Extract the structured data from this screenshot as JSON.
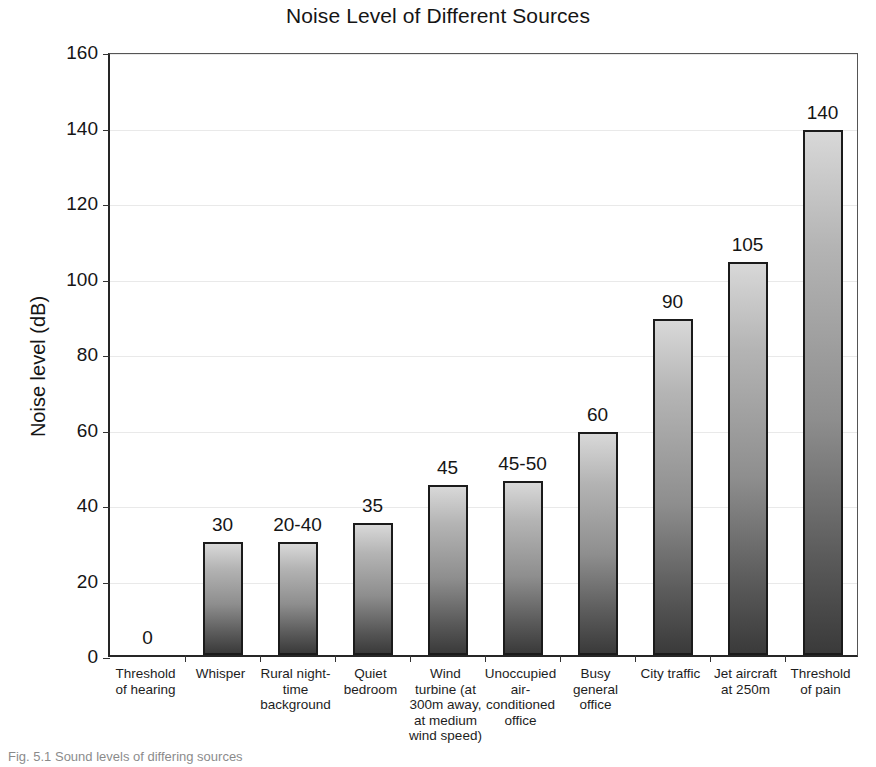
{
  "chart_data": {
    "type": "bar",
    "title": "Noise Level of Different Sources",
    "xlabel": "",
    "ylabel": "Noise level (dB)",
    "ylim": [
      0,
      160
    ],
    "yticks": [
      0,
      20,
      40,
      60,
      80,
      100,
      120,
      140,
      160
    ],
    "grid": true,
    "legend": false,
    "categories": [
      "Threshold of hearing",
      "Whisper",
      "Rural night-time background",
      "Quiet bedroom",
      "Wind turbine (at 300m away, at medium wind speed)",
      "Unoccupied air-conditioned office",
      "Busy general office",
      "City traffic",
      "Jet aircraft at 250m",
      "Threshold of pain"
    ],
    "category_lines": [
      [
        "Threshold",
        "of hearing"
      ],
      [
        "Whisper"
      ],
      [
        "Rural night-",
        "time",
        "background"
      ],
      [
        "Quiet",
        "bedroom"
      ],
      [
        "Wind",
        "turbine (at",
        "300m away,",
        "at medium",
        "wind speed)"
      ],
      [
        "Unoccupied",
        "air-",
        "conditioned",
        "office"
      ],
      [
        "Busy",
        "general",
        "office"
      ],
      [
        "City traffic"
      ],
      [
        "Jet aircraft",
        "at 250m"
      ],
      [
        "Threshold",
        "of pain"
      ]
    ],
    "values": [
      0,
      30,
      30,
      35,
      45,
      46,
      59,
      89,
      104,
      139
    ],
    "data_labels": [
      "0",
      "30",
      "20-40",
      "35",
      "45",
      "45-50",
      "60",
      "90",
      "105",
      "140"
    ]
  },
  "caption": {
    "text": "Fig. 5.1  Sound levels of differing sources"
  },
  "colors": {
    "bar_top": "#d8d8d8",
    "bar_bottom": "#3a3a3a",
    "bar_border": "#1b1b1b",
    "axis": "#262626",
    "grid": "#e9e9e9",
    "text": "#151515",
    "background": "#ffffff"
  }
}
